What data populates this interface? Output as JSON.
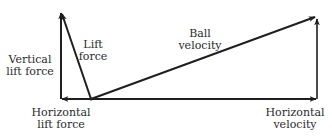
{
  "diagram": {
    "type": "vector-decomposition",
    "colors": {
      "line": "#1f1f1f",
      "text": "#2b2b2b",
      "background": "#ffffff"
    },
    "labels": {
      "vertical_lift_force": [
        "Vertical",
        "lift force"
      ],
      "lift_force": [
        "Lift",
        "force"
      ],
      "ball_velocity": [
        "Ball",
        "velocity"
      ],
      "horizontal_lift_force": [
        "Horizontal",
        "lift force"
      ],
      "horizontal_velocity": [
        "Horizontal",
        "velocity"
      ]
    },
    "vectors": [
      {
        "name": "lift-force",
        "from": [
          91,
          99
        ],
        "to": [
          61,
          12
        ]
      },
      {
        "name": "vertical-lift-force",
        "from": [
          61,
          99
        ],
        "to": [
          61,
          12
        ]
      },
      {
        "name": "horizontal-lift-force",
        "from": [
          91,
          99
        ],
        "to": [
          61,
          99
        ]
      },
      {
        "name": "ball-velocity",
        "from": [
          91,
          99
        ],
        "to": [
          316,
          17
        ]
      },
      {
        "name": "horizontal-velocity",
        "from": [
          91,
          99
        ],
        "to": [
          317,
          99
        ]
      },
      {
        "name": "vertical-velocity-component",
        "from": [
          317,
          99
        ],
        "to": [
          317,
          18
        ]
      }
    ]
  }
}
